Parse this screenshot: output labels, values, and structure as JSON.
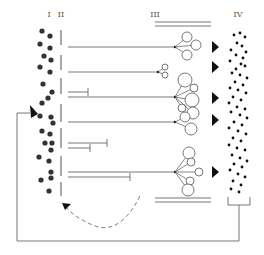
{
  "diagram": {
    "labels": {
      "col1": "I",
      "col2": "II",
      "col3": "III",
      "col4": "IV"
    },
    "colors": {
      "stroke": "#555555",
      "dot": "#333333",
      "ink": "#111111",
      "background": "#ffffff"
    },
    "col1_dots": [
      [
        42,
        31
      ],
      [
        50,
        36
      ],
      [
        40,
        44
      ],
      [
        50,
        48
      ],
      [
        44,
        56
      ],
      [
        51,
        60
      ],
      [
        40,
        67
      ],
      [
        50,
        72
      ],
      [
        43,
        84
      ],
      [
        52,
        92
      ],
      [
        48,
        98
      ],
      [
        42,
        103
      ],
      [
        40,
        116
      ],
      [
        51,
        117
      ],
      [
        53,
        123
      ],
      [
        42,
        131
      ],
      [
        50,
        134
      ],
      [
        45,
        143
      ],
      [
        52,
        143
      ],
      [
        51,
        150
      ],
      [
        39,
        157
      ],
      [
        49,
        161
      ],
      [
        51,
        172
      ],
      [
        41,
        180
      ],
      [
        51,
        178
      ],
      [
        49,
        191
      ]
    ],
    "col4_dots": [
      [
        234,
        35
      ],
      [
        240,
        33
      ],
      [
        245,
        37
      ],
      [
        237,
        43
      ],
      [
        242,
        46
      ],
      [
        231,
        50
      ],
      [
        246,
        52
      ],
      [
        236,
        55
      ],
      [
        243,
        58
      ],
      [
        230,
        61
      ],
      [
        241,
        64
      ],
      [
        236,
        69
      ],
      [
        245,
        66
      ],
      [
        232,
        73
      ],
      [
        240,
        75
      ],
      [
        247,
        78
      ],
      [
        235,
        82
      ],
      [
        243,
        85
      ],
      [
        230,
        88
      ],
      [
        238,
        90
      ],
      [
        246,
        93
      ],
      [
        233,
        97
      ],
      [
        241,
        100
      ],
      [
        229,
        103
      ],
      [
        237,
        107
      ],
      [
        245,
        109
      ],
      [
        231,
        112
      ],
      [
        240,
        115
      ],
      [
        247,
        118
      ],
      [
        234,
        122
      ],
      [
        242,
        125
      ],
      [
        229,
        128
      ],
      [
        238,
        131
      ],
      [
        246,
        134
      ],
      [
        233,
        138
      ],
      [
        241,
        141
      ],
      [
        229,
        145
      ],
      [
        237,
        148
      ],
      [
        245,
        150
      ],
      [
        232,
        155
      ],
      [
        240,
        158
      ],
      [
        247,
        161
      ],
      [
        234,
        164
      ],
      [
        242,
        167
      ],
      [
        230,
        170
      ],
      [
        238,
        174
      ],
      [
        245,
        177
      ],
      [
        233,
        181
      ],
      [
        241,
        185
      ],
      [
        231,
        189
      ],
      [
        239,
        192
      ]
    ],
    "col2_segments": [
      [
        30,
        45
      ],
      [
        55,
        70
      ],
      [
        78,
        94
      ],
      [
        104,
        122
      ],
      [
        128,
        148
      ],
      [
        156,
        176
      ],
      [
        182,
        196
      ]
    ],
    "signal_lines": [
      {
        "y": 47,
        "x1": 68,
        "x2": 175,
        "end": "branch"
      },
      {
        "y": 72,
        "x1": 68,
        "x2": 158,
        "end": "branch"
      },
      {
        "y": 92,
        "x1": 68,
        "x2": 88,
        "end": "bar"
      },
      {
        "y": 97,
        "x1": 68,
        "x2": 175,
        "end": "branch"
      },
      {
        "y": 122,
        "x1": 68,
        "x2": 175,
        "end": "branch"
      },
      {
        "y": 143,
        "x1": 68,
        "x2": 107,
        "end": "bar"
      },
      {
        "y": 148,
        "x1": 68,
        "x2": 90,
        "end": "bar"
      },
      {
        "y": 172,
        "x1": 68,
        "x2": 175,
        "end": "branch"
      },
      {
        "y": 177,
        "x1": 68,
        "x2": 130,
        "end": "bar"
      }
    ],
    "branch_groups": [
      {
        "origin": [
          175,
          47
        ],
        "circles": [
          [
            187,
            37,
            5
          ],
          [
            196,
            45,
            5
          ],
          [
            187,
            55,
            5
          ]
        ]
      },
      {
        "origin": [
          158,
          72
        ],
        "circles": [
          [
            165,
            67,
            3
          ],
          [
            165,
            75,
            3
          ]
        ]
      },
      {
        "origin": [
          175,
          97
        ],
        "circles": [
          [
            185,
            80,
            7
          ],
          [
            194,
            88,
            4
          ],
          [
            192,
            100,
            7
          ],
          [
            182,
            108,
            4
          ],
          [
            193,
            113,
            6
          ]
        ]
      },
      {
        "origin": [
          175,
          122
        ],
        "circles": [
          [
            185,
            117,
            5
          ],
          [
            191,
            129,
            6
          ]
        ]
      },
      {
        "origin": [
          175,
          172
        ],
        "circles": [
          [
            189,
            153,
            6
          ],
          [
            191,
            162,
            4
          ],
          [
            199,
            172,
            4
          ],
          [
            190,
            181,
            4
          ],
          [
            188,
            190,
            6
          ]
        ]
      }
    ],
    "triangles": [
      [
        212,
        47
      ],
      [
        212,
        67
      ],
      [
        212,
        98
      ],
      [
        212,
        120
      ],
      [
        212,
        172
      ]
    ],
    "double_bars": [
      {
        "y1": 22,
        "y2": 26,
        "x1": 155,
        "x2": 211
      },
      {
        "y1": 198,
        "y2": 202,
        "x1": 155,
        "x2": 211
      }
    ],
    "bracket": {
      "x1": 228,
      "x2": 250,
      "y1": 197,
      "y2": 205
    },
    "feedback_loop": {
      "points": [
        [
          239,
          205
        ],
        [
          239,
          241
        ],
        [
          17,
          241
        ],
        [
          17,
          113
        ],
        [
          30,
          113
        ]
      ],
      "arrow_tip": [
        38,
        113
      ]
    },
    "dashed_arrow": {
      "path": "M 140 196 Q 120 235 95 226 Q 75 218 66 207",
      "arrow_tip": [
        62,
        203
      ]
    }
  }
}
